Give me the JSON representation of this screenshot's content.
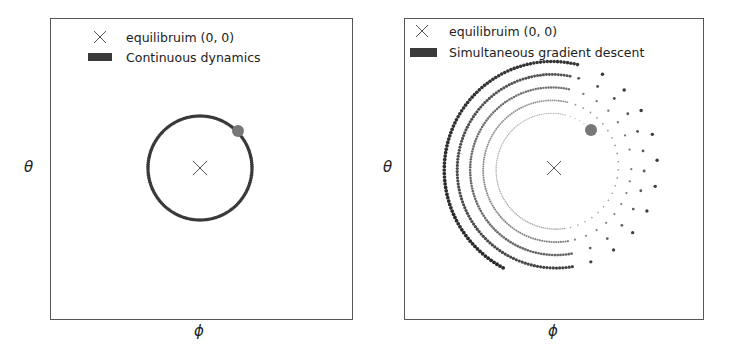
{
  "chart_data": [
    {
      "type": "scatter",
      "title": "",
      "xlabel": "φ",
      "ylabel": "θ",
      "grid": false,
      "ticks": "none",
      "legend_position": "upper center",
      "legend": [
        {
          "marker": "x",
          "label": "equilibruim (0, 0)"
        },
        {
          "marker": "patch",
          "label": "Continuous dynamics"
        }
      ],
      "equilibrium": {
        "x": 0,
        "y": 0
      },
      "trajectory": {
        "shape": "circle",
        "center": [
          0,
          0
        ],
        "radius": 1.0,
        "behavior": "closed orbit around equilibrium"
      },
      "start_point": {
        "angle_deg": 45,
        "radius": 1.0
      }
    },
    {
      "type": "scatter",
      "title": "",
      "xlabel": "φ",
      "ylabel": "θ",
      "grid": false,
      "ticks": "none",
      "legend_position": "upper left",
      "legend": [
        {
          "marker": "x",
          "label": "equilibruim (0, 0)"
        },
        {
          "marker": "patch",
          "label": "Simultaneous gradient descent"
        }
      ],
      "equilibrium": {
        "x": 0,
        "y": 0
      },
      "trajectory": {
        "shape": "outward spiral",
        "center": [
          0,
          0
        ],
        "start_radius": 1.0,
        "end_radius": 2.1,
        "turns": 4.6,
        "behavior": "diverges away from equilibrium"
      },
      "start_point": {
        "angle_deg": 45,
        "radius": 1.0
      }
    }
  ],
  "panels": [
    {
      "legend": {
        "equilibrium_label": "equilibruim (0, 0)",
        "trajectory_label": "Continuous dynamics"
      },
      "xlabel": "ϕ",
      "ylabel": "θ"
    },
    {
      "legend": {
        "equilibrium_label": "equilibruim (0, 0)",
        "trajectory_label": "Simultaneous gradient descent"
      },
      "xlabel": "ϕ",
      "ylabel": "θ"
    }
  ],
  "colors": {
    "frame": "#555555",
    "trajectory": "#333333",
    "start_dot": "#777777",
    "marker_x": "#555555"
  }
}
